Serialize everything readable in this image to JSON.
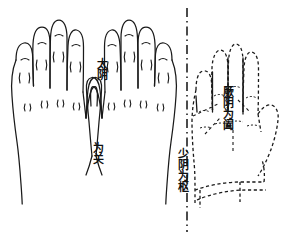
{
  "figure": {
    "background_color": "#ffffff",
    "stroke_color": "#1a1a1a",
    "dashed_stroke_color": "#1a1a1a",
    "width": 286,
    "height": 238
  },
  "labels": {
    "taiyin": "太阴",
    "weiguan": "为关",
    "shaoyin": "少阴为枢",
    "jueyin": "厥阴为阖"
  },
  "elements": {
    "left_hand_name": "left-hand-solid",
    "middle_hand_name": "middle-hand-solid",
    "right_hand_name": "right-hand-dashed",
    "axis_name": "vertical-dash-dot-axis"
  }
}
